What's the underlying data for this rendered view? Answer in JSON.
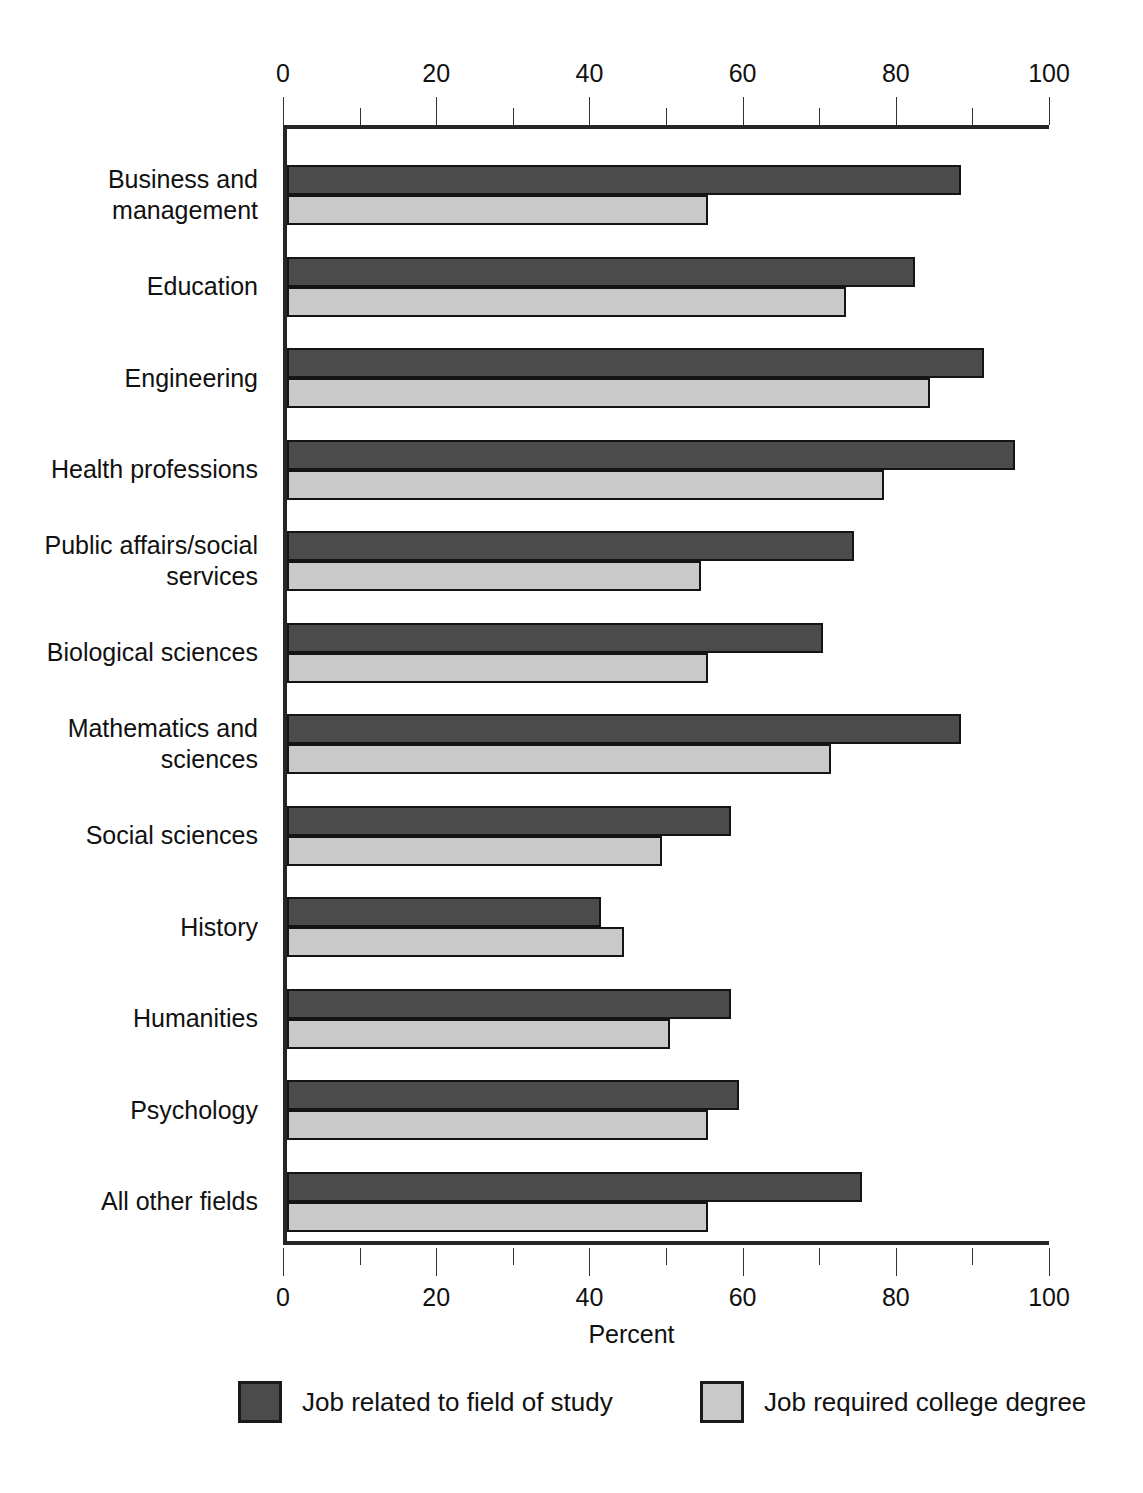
{
  "chart_data": {
    "type": "bar",
    "orientation": "horizontal",
    "title": "",
    "xlabel": "Percent",
    "ylabel": "",
    "xlim": [
      0,
      100
    ],
    "xticks": [
      0,
      20,
      40,
      60,
      80,
      100
    ],
    "xtick_labels": [
      "0",
      "20",
      "40",
      "60",
      "80",
      "100"
    ],
    "minor_tick_step": 10,
    "grid": false,
    "legend_position": "bottom",
    "axis_top_duplicate": true,
    "categories": [
      "Business and management",
      "Education",
      "Engineering",
      "Health professions",
      "Public affairs/social services",
      "Biological sciences",
      "Mathematics and sciences",
      "Social sciences",
      "History",
      "Humanities",
      "Psychology",
      "All other fields"
    ],
    "category_label_lines": [
      [
        "Business and",
        "management"
      ],
      [
        "Education"
      ],
      [
        "Engineering"
      ],
      [
        "Health professions"
      ],
      [
        "Public affairs/social",
        "services"
      ],
      [
        "Biological sciences"
      ],
      [
        "Mathematics and",
        "sciences"
      ],
      [
        "Social sciences"
      ],
      [
        "History"
      ],
      [
        "Humanities"
      ],
      [
        "Psychology"
      ],
      [
        "All other fields"
      ]
    ],
    "series": [
      {
        "name": "Job related to field of study",
        "color": "#4b4b4b",
        "values": [
          88,
          82,
          91,
          95,
          74,
          70,
          88,
          58,
          41,
          58,
          59,
          75
        ]
      },
      {
        "name": "Job required college degree",
        "color": "#c9c9c9",
        "values": [
          55,
          73,
          84,
          78,
          54,
          55,
          71,
          49,
          44,
          50,
          55,
          55
        ]
      }
    ]
  },
  "axis": {
    "x_title": "Percent"
  },
  "legend": {
    "items": [
      {
        "label": "Job related to field of study",
        "swatch": "dark-swatch"
      },
      {
        "label": "Job required college degree",
        "swatch": "light-swatch"
      }
    ]
  },
  "colors": {
    "series_dark": "#4b4b4b",
    "series_light": "#c9c9c9",
    "axis": "#262626",
    "text": "#111111"
  }
}
